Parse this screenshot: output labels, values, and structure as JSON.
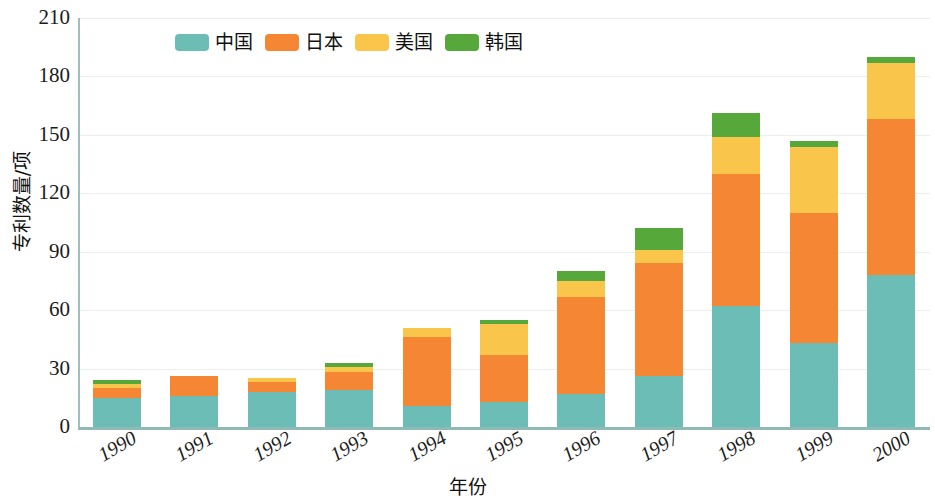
{
  "chart_data": {
    "type": "bar",
    "stacked": true,
    "title": "",
    "xlabel": "年份",
    "ylabel": "专利数量/项",
    "ylim": [
      0,
      210
    ],
    "yticks": [
      0,
      30,
      60,
      90,
      120,
      150,
      180,
      210
    ],
    "grid": true,
    "legend_position": "top-center",
    "categories": [
      "1990",
      "1991",
      "1992",
      "1993",
      "1994",
      "1995",
      "1996",
      "1997",
      "1998",
      "1999",
      "2000"
    ],
    "series": [
      {
        "name": "中国",
        "color": "#6cbdb5",
        "values": [
          15,
          16,
          18,
          19,
          11,
          13,
          17,
          26,
          62,
          43,
          78
        ]
      },
      {
        "name": "日本",
        "color": "#f58634",
        "values": [
          5,
          10,
          5,
          9,
          35,
          24,
          50,
          58,
          68,
          67,
          80
        ]
      },
      {
        "name": "美国",
        "color": "#fac54b",
        "values": [
          2,
          0,
          2,
          3,
          5,
          16,
          8,
          7,
          19,
          34,
          29
        ]
      },
      {
        "name": "韩国",
        "color": "#57a83a",
        "values": [
          2,
          0,
          0,
          2,
          0,
          2,
          5,
          11,
          12,
          3,
          3
        ]
      }
    ],
    "totals": [
      24,
      26,
      25,
      33,
      51,
      55,
      80,
      102,
      161,
      147,
      190
    ]
  },
  "legend": {
    "entries": [
      {
        "label": "中国",
        "color": "#6cbdb5"
      },
      {
        "label": "日本",
        "color": "#f58634"
      },
      {
        "label": "美国",
        "color": "#fac54b"
      },
      {
        "label": "韩国",
        "color": "#57a83a"
      }
    ]
  },
  "axes": {
    "y_title": "专利数量/项",
    "x_title": "年份",
    "y_labels": [
      "210",
      "180",
      "150",
      "120",
      "90",
      "60",
      "30",
      "0"
    ],
    "x_labels": [
      "1990",
      "1991",
      "1992",
      "1993",
      "1994",
      "1995",
      "1996",
      "1997",
      "1998",
      "1999",
      "2000"
    ]
  }
}
